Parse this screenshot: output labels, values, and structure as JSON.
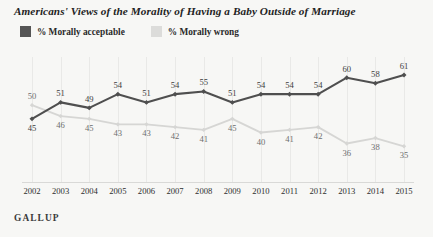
{
  "chart_data": {
    "type": "line",
    "title": "Americans' Views of the Morality of Having a Baby Outside of Marriage",
    "xlabel": "",
    "ylabel": "",
    "ylim": [
      30,
      65
    ],
    "grid": "vertical",
    "legend_position": "top-left",
    "source": "GALLUP",
    "categories": [
      "2002",
      "2003",
      "2004",
      "2005",
      "2006",
      "2007",
      "2008",
      "2009",
      "2010",
      "2011",
      "2012",
      "2013",
      "2014",
      "2015"
    ],
    "series": [
      {
        "name": "% Morally acceptable",
        "color": "#4f4f4f",
        "swatch": "#555555",
        "values": [
          45,
          51,
          49,
          54,
          51,
          54,
          55,
          51,
          54,
          54,
          54,
          60,
          58,
          61
        ],
        "label_position": [
          "below",
          "above",
          "above",
          "above",
          "above",
          "above",
          "above",
          "above",
          "above",
          "above",
          "above",
          "above",
          "above",
          "above"
        ]
      },
      {
        "name": "% Morally wrong",
        "color": "#d6d6d4",
        "swatch": "#dcdcda",
        "values": [
          50,
          46,
          45,
          43,
          43,
          42,
          41,
          45,
          40,
          41,
          42,
          36,
          38,
          35
        ],
        "label_position": [
          "above",
          "below",
          "below",
          "below",
          "below",
          "below",
          "below",
          "below",
          "below",
          "below",
          "below",
          "below",
          "below",
          "below"
        ]
      }
    ]
  }
}
